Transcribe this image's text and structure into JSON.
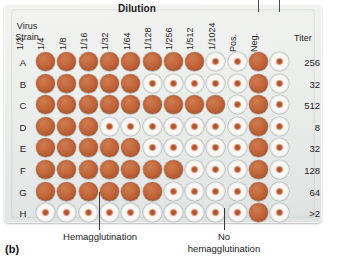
{
  "figure": {
    "panel_letter": "(b)",
    "dilution_title": "Dilution",
    "virus_strain_label_line1": "Virus",
    "virus_strain_label_line2": "Strain",
    "titer_header": "Titer",
    "caption_hemagglutination": "Hemagglutination",
    "caption_no_hemagglutination_line1": "No",
    "caption_no_hemagglutination_line2": "hemagglutination"
  },
  "colors": {
    "agglutinated_well": "#c56a3e",
    "button_well_center": "#b3522b",
    "well_rim": "#aeb7ba",
    "plate_body": "#eceeec",
    "text": "#1d1d1d"
  },
  "columns": [
    {
      "label": "1/2",
      "kind": "dilution"
    },
    {
      "label": "1/4",
      "kind": "dilution"
    },
    {
      "label": "1/8",
      "kind": "dilution"
    },
    {
      "label": "1/16",
      "kind": "dilution"
    },
    {
      "label": "1/32",
      "kind": "dilution"
    },
    {
      "label": "1/64",
      "kind": "dilution"
    },
    {
      "label": "1/128",
      "kind": "dilution"
    },
    {
      "label": "1/256",
      "kind": "dilution"
    },
    {
      "label": "1/512",
      "kind": "dilution"
    },
    {
      "label": "1/1024",
      "kind": "dilution"
    },
    {
      "label": "Pos.",
      "kind": "control"
    },
    {
      "label": "Neg.",
      "kind": "control"
    }
  ],
  "rows": [
    {
      "label": "A",
      "titer": "256",
      "wells": [
        "agg",
        "agg",
        "agg",
        "agg",
        "agg",
        "agg",
        "agg",
        "agg",
        "btn",
        "btn",
        "agg",
        "btn"
      ]
    },
    {
      "label": "B",
      "titer": "32",
      "wells": [
        "agg",
        "agg",
        "agg",
        "agg",
        "agg",
        "btn",
        "btn",
        "btn",
        "btn",
        "btn",
        "agg",
        "btn"
      ]
    },
    {
      "label": "C",
      "titer": "512",
      "wells": [
        "agg",
        "agg",
        "agg",
        "agg",
        "agg",
        "agg",
        "agg",
        "agg",
        "agg",
        "btn",
        "agg",
        "btn"
      ]
    },
    {
      "label": "D",
      "titer": "8",
      "wells": [
        "agg",
        "agg",
        "agg",
        "btn",
        "btn",
        "btn",
        "btn",
        "btn",
        "btn",
        "btn",
        "agg",
        "btn"
      ]
    },
    {
      "label": "E",
      "titer": "32",
      "wells": [
        "agg",
        "agg",
        "agg",
        "agg",
        "agg",
        "btn",
        "btn",
        "btn",
        "btn",
        "btn",
        "agg",
        "btn"
      ]
    },
    {
      "label": "F",
      "titer": "128",
      "wells": [
        "agg",
        "agg",
        "agg",
        "agg",
        "agg",
        "agg",
        "agg",
        "btn",
        "btn",
        "btn",
        "agg",
        "btn"
      ]
    },
    {
      "label": "G",
      "titer": "64",
      "wells": [
        "agg",
        "agg",
        "agg",
        "agg",
        "agg",
        "agg",
        "btn",
        "btn",
        "btn",
        "btn",
        "agg",
        "btn"
      ]
    },
    {
      "label": "H",
      "titer": ">2",
      "wells": [
        "btn",
        "btn",
        "btn",
        "btn",
        "btn",
        "btn",
        "btn",
        "btn",
        "btn",
        "btn",
        "agg",
        "btn"
      ]
    }
  ],
  "chart_data": {
    "type": "table",
    "xlabel": "Dilution",
    "ylabel": "Virus Strain",
    "categories": [
      "1/2",
      "1/4",
      "1/8",
      "1/16",
      "1/32",
      "1/64",
      "1/128",
      "1/256",
      "1/512",
      "1/1024",
      "Pos.",
      "Neg."
    ],
    "series": [
      {
        "name": "A",
        "titer": 256,
        "values": [
          1,
          1,
          1,
          1,
          1,
          1,
          1,
          1,
          0,
          0,
          1,
          0
        ]
      },
      {
        "name": "B",
        "titer": 32,
        "values": [
          1,
          1,
          1,
          1,
          1,
          0,
          0,
          0,
          0,
          0,
          1,
          0
        ]
      },
      {
        "name": "C",
        "titer": 512,
        "values": [
          1,
          1,
          1,
          1,
          1,
          1,
          1,
          1,
          1,
          0,
          1,
          0
        ]
      },
      {
        "name": "D",
        "titer": 8,
        "values": [
          1,
          1,
          1,
          0,
          0,
          0,
          0,
          0,
          0,
          0,
          1,
          0
        ]
      },
      {
        "name": "E",
        "titer": 32,
        "values": [
          1,
          1,
          1,
          1,
          1,
          0,
          0,
          0,
          0,
          0,
          1,
          0
        ]
      },
      {
        "name": "F",
        "titer": 128,
        "values": [
          1,
          1,
          1,
          1,
          1,
          1,
          1,
          0,
          0,
          0,
          1,
          0
        ]
      },
      {
        "name": "G",
        "titer": 64,
        "values": [
          1,
          1,
          1,
          1,
          1,
          1,
          0,
          0,
          0,
          0,
          1,
          0
        ]
      },
      {
        "name": "H",
        "titer": ">2",
        "values": [
          0,
          0,
          0,
          0,
          0,
          0,
          0,
          0,
          0,
          0,
          1,
          0
        ]
      }
    ],
    "legend": [
      "Hemagglutination = 1 (filled well)",
      "No hemagglutination = 0 (button well)"
    ],
    "grid": false
  }
}
